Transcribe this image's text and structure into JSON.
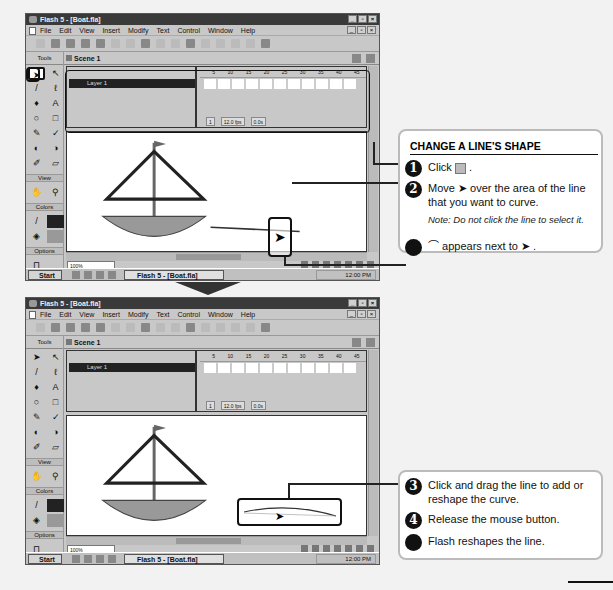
{
  "window": {
    "title": "Flash 5 - [Boat.fla]",
    "menus": [
      "File",
      "Edit",
      "View",
      "Insert",
      "Modify",
      "Text",
      "Control",
      "Window",
      "Help"
    ],
    "scene": "Scene 1",
    "tools_label": "Tools",
    "sections": {
      "view": "View",
      "colors": "Colors",
      "options": "Options"
    },
    "layer_name": "Layer 1",
    "ruler_ticks": [
      "5",
      "10",
      "15",
      "20",
      "25",
      "30",
      "35",
      "40",
      "45"
    ],
    "frame_number": "1",
    "frame_rate": "12.0 fps",
    "elapsed": "0.0s",
    "zoom_level": "100%",
    "taskbar": {
      "start": "Start",
      "task": "Flash 5 - [Boat.fla]",
      "clock": "12:00 PM"
    }
  },
  "panel1": {
    "title": "CHANGE A LINE'S SHAPE",
    "steps": [
      {
        "num": "1",
        "text": "Click",
        "icon": "arrow-tool-icon"
      },
      {
        "num": "2",
        "text_a": "Move",
        "text_b": "over the area of the line that you want to curve."
      },
      {
        "num": "",
        "text_a": "appears next to",
        "icon": "curve-cursor-icon"
      }
    ],
    "note": "Note: Do not click the line to select it."
  },
  "panel2": {
    "steps": [
      {
        "num": "3",
        "text": "Click and drag the line to add or reshape the curve."
      },
      {
        "num": "4",
        "text": "Release the mouse button."
      },
      {
        "num": "",
        "text": "Flash reshapes the line."
      }
    ]
  },
  "colors": {
    "accent": "#111111",
    "titlebar": "#3a3a3a",
    "hull": "#999999"
  }
}
